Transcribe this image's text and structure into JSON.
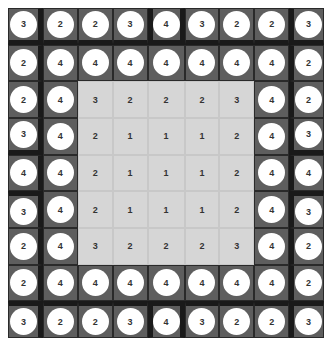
{
  "board": {
    "rows": 9,
    "cols": 9,
    "cells": [
      [
        3,
        2,
        2,
        3,
        4,
        3,
        2,
        2,
        3
      ],
      [
        2,
        4,
        4,
        4,
        4,
        4,
        4,
        4,
        2
      ],
      [
        2,
        4,
        3,
        2,
        2,
        2,
        3,
        4,
        2
      ],
      [
        3,
        4,
        2,
        1,
        1,
        1,
        2,
        4,
        3
      ],
      [
        4,
        4,
        2,
        1,
        1,
        1,
        2,
        4,
        4
      ],
      [
        3,
        4,
        2,
        1,
        1,
        1,
        2,
        4,
        3
      ],
      [
        2,
        4,
        3,
        2,
        2,
        2,
        3,
        4,
        2
      ],
      [
        2,
        4,
        4,
        4,
        4,
        4,
        4,
        4,
        2
      ],
      [
        3,
        2,
        2,
        3,
        4,
        3,
        2,
        2,
        3
      ]
    ],
    "inner_region": {
      "row_start": 2,
      "row_end": 6,
      "col_start": 2,
      "col_end": 6
    },
    "colors": {
      "outer_cell": "#5e5e5e",
      "inner_cell": "#d6d6d6",
      "disc": "#ffffff",
      "wall": "#1a1a1a",
      "text": "#333333"
    }
  }
}
